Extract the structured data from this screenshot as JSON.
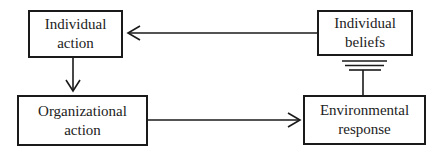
{
  "diagram": {
    "nodes": [
      {
        "id": "individual-action",
        "line1": "Individual",
        "line2": "action"
      },
      {
        "id": "individual-beliefs",
        "line1": "Individual",
        "line2": "beliefs"
      },
      {
        "id": "organizational-action",
        "line1": "Organizational",
        "line2": "action"
      },
      {
        "id": "environmental-response",
        "line1": "Environmental",
        "line2": "response"
      }
    ],
    "edges": [
      {
        "from": "individual-beliefs",
        "to": "individual-action",
        "type": "arrow"
      },
      {
        "from": "individual-action",
        "to": "organizational-action",
        "type": "arrow"
      },
      {
        "from": "organizational-action",
        "to": "environmental-response",
        "type": "arrow"
      },
      {
        "from": "environmental-response",
        "to": "individual-beliefs",
        "type": "blocked (T-bar barrier)"
      }
    ],
    "colors": {
      "stroke": "#1a1a1a",
      "background": "#ffffff"
    }
  }
}
